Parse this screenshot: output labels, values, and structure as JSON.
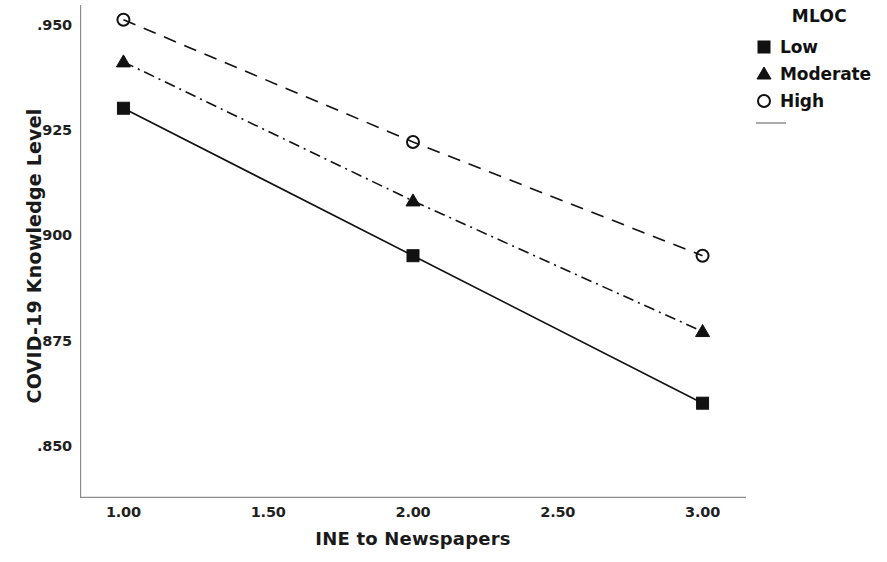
{
  "chart_data": {
    "type": "line",
    "title": "",
    "xlabel": "INE to Newspapers",
    "ylabel": "COVID-19 Knowledge Level",
    "x": [
      1.0,
      2.0,
      3.0
    ],
    "xlim": [
      0.85,
      3.15
    ],
    "ylim": [
      0.8365,
      0.9535
    ],
    "xticks": [
      "1.00",
      "1.50",
      "2.00",
      "2.50",
      "3.00"
    ],
    "xtick_values": [
      1.0,
      1.5,
      2.0,
      2.5,
      3.0
    ],
    "yticks": [
      ".950",
      ".925",
      ".900",
      ".875",
      ".850"
    ],
    "ytick_values": [
      0.95,
      0.925,
      0.9,
      0.875,
      0.85
    ],
    "grid": false,
    "legend_position": "right",
    "legend_title": "MLOC",
    "series": [
      {
        "name": "Low",
        "marker": "filled-square",
        "linestyle": "solid",
        "color": "#111111",
        "values": [
          0.929,
          0.894,
          0.859
        ]
      },
      {
        "name": "Moderate",
        "marker": "filled-triangle",
        "linestyle": "dash-dot",
        "color": "#111111",
        "values": [
          0.94,
          0.907,
          0.876
        ]
      },
      {
        "name": "High",
        "marker": "open-circle",
        "linestyle": "dashed",
        "color": "#111111",
        "values": [
          0.95,
          0.921,
          0.894
        ]
      }
    ]
  },
  "axes": {
    "y_title": "COVID-19 Knowledge Level",
    "x_title": "INE to Newspapers"
  },
  "legend": {
    "title": "MLOC",
    "items": [
      {
        "label": "Low",
        "marker": "filled-square"
      },
      {
        "label": "Moderate",
        "marker": "filled-triangle"
      },
      {
        "label": "High",
        "marker": "open-circle"
      }
    ]
  }
}
